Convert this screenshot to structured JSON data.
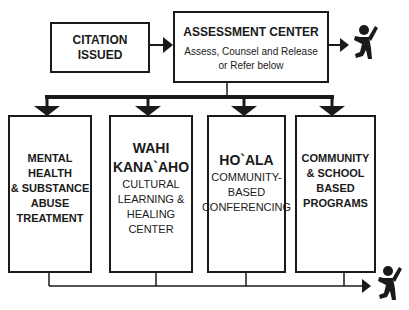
{
  "diagram": {
    "start": {
      "label_line1": "CITATION",
      "label_line2": "ISSUED"
    },
    "assessment": {
      "title": "ASSESSMENT CENTER",
      "subtitle_line1": "Assess, Counsel and Release",
      "subtitle_line2": "or Refer below"
    },
    "programs": [
      {
        "lines": [
          "MENTAL HEALTH",
          "& SUBSTANCE",
          "ABUSE",
          "TREATMENT"
        ]
      },
      {
        "title_lines": [
          "WAHI",
          "KANA`AHO"
        ],
        "sub_lines": [
          "CULTURAL",
          "LEARNING &",
          "HEALING",
          "CENTER"
        ]
      },
      {
        "title_lines": [
          "HO`ALA"
        ],
        "sub_lines": [
          "COMMUNITY-",
          "BASED",
          "CONFERENCING"
        ]
      },
      {
        "lines": [
          "COMMUNITY",
          "& SCHOOL",
          "BASED",
          "PROGRAMS"
        ]
      }
    ],
    "outcome_icon": "child-jumping-icon",
    "colors": {
      "stroke": "#1a1a1a",
      "background": "#ffffff"
    }
  }
}
